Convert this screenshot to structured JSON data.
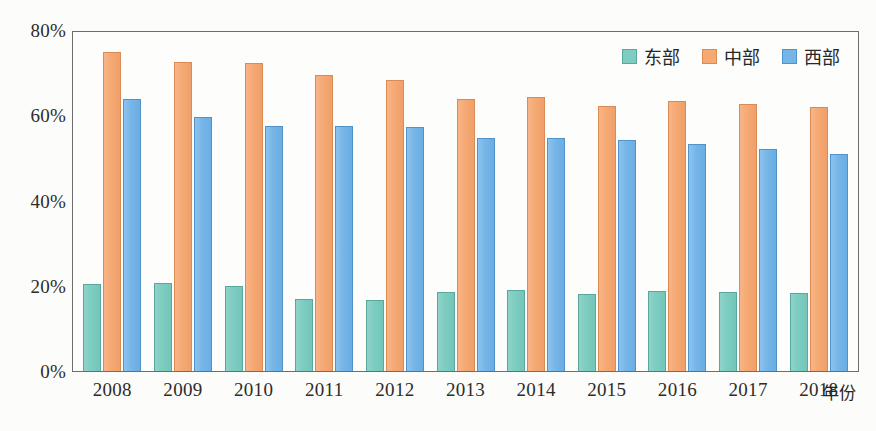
{
  "chart_data": {
    "type": "bar",
    "title": "",
    "subtitle": "",
    "xlabel": "年份",
    "ylabel": "",
    "ylim": [
      0,
      80
    ],
    "y_unit": "%",
    "grid": false,
    "legend_position": "top-right",
    "categories": [
      "2008",
      "2009",
      "2010",
      "2011",
      "2012",
      "2013",
      "2014",
      "2015",
      "2016",
      "2017",
      "2018"
    ],
    "y_ticks": [
      0,
      20,
      40,
      60,
      80
    ],
    "y_tick_labels": [
      "0%",
      "20%",
      "40%",
      "60%",
      "80%"
    ],
    "series": [
      {
        "name": "东部",
        "color": "#7ecdc1",
        "values": [
          20.4,
          20.6,
          20.0,
          17.0,
          16.7,
          18.5,
          19.0,
          18.0,
          18.7,
          18.5,
          18.3
        ]
      },
      {
        "name": "中部",
        "color": "#f5a973",
        "values": [
          74.8,
          72.4,
          72.2,
          69.5,
          68.3,
          63.8,
          64.2,
          62.2,
          63.4,
          62.7,
          62.0
        ]
      },
      {
        "name": "西部",
        "color": "#76b5e8",
        "values": [
          63.8,
          59.6,
          57.4,
          57.5,
          57.2,
          54.7,
          54.6,
          54.3,
          53.2,
          52.1,
          50.8
        ]
      }
    ]
  },
  "colors": {
    "east": "#7ecdc1",
    "central": "#f5a973",
    "west": "#76b5e8",
    "frame": "#6d6d6d",
    "background": "#fcfcfa",
    "text": "#2c2c2c"
  }
}
